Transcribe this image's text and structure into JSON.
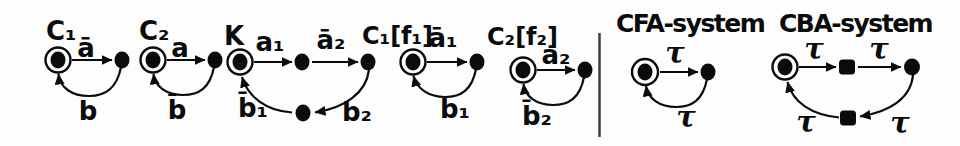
{
  "figure": {
    "background": "#fdfdfd",
    "ink": "#0b0b0b",
    "divider_color": "#3d3d3d"
  },
  "automata": [
    {
      "name": "C1",
      "title": "C₁",
      "type": "two-state-cycle",
      "initial_state": "double-circled",
      "transitions": {
        "forward": "ā",
        "back": "b"
      }
    },
    {
      "name": "C2",
      "title": "C₂",
      "type": "two-state-cycle",
      "initial_state": "double-circled",
      "transitions": {
        "forward": "a",
        "back": "b̄"
      }
    },
    {
      "name": "K",
      "title": "K",
      "type": "four-state-cycle",
      "initial_state": "double-circled",
      "transitions": {
        "forward1": "a₁",
        "forward2": "ā₂",
        "back_right": "b₂",
        "back_left": "b̄₁"
      }
    },
    {
      "name": "C1f1",
      "title": "C₁[f₁]",
      "type": "two-state-cycle",
      "initial_state": "double-circled",
      "transitions": {
        "forward": "ā₁",
        "back": "b₁"
      }
    },
    {
      "name": "C2f2",
      "title": "C₂[f₂]",
      "type": "two-state-cycle",
      "initial_state": "double-circled",
      "transitions": {
        "forward": "a₂",
        "back": "b̄₂"
      }
    },
    {
      "name": "CFA",
      "title": "CFA-system",
      "type": "two-state-cycle",
      "initial_state": "double-circled",
      "transitions": {
        "forward": "τ",
        "back": "τ"
      }
    },
    {
      "name": "CBA",
      "title": "CBA-system",
      "type": "four-state-cycle",
      "initial_state": "double-circled",
      "transitions": {
        "forward1": "τ",
        "forward2": "τ",
        "back_right": "τ",
        "back_left": "τ"
      }
    }
  ]
}
